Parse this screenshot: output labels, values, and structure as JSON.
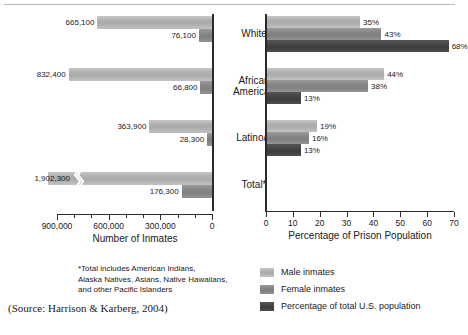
{
  "chart_data": [
    {
      "type": "bar",
      "orientation": "horizontal-reversed",
      "title": "",
      "xlabel": "Number of Inmates",
      "ylabel": "",
      "categories": [
        "White",
        "African American",
        "Latino/a",
        "Total*"
      ],
      "xlim": [
        0,
        900000
      ],
      "xticks": [
        900000,
        600000,
        300000,
        0
      ],
      "xtick_labels": [
        "900,000",
        "600,000",
        "300,000",
        "0"
      ],
      "minor_ticks": true,
      "grid": false,
      "series": [
        {
          "name": "Male inmates",
          "color": "#b3b3b3",
          "values": [
            665100,
            832400,
            363900,
            1902300
          ],
          "labels": [
            "665,100",
            "832,400",
            "363,900",
            "1,902,300"
          ],
          "axis_break_on": [
            "Total*"
          ]
        },
        {
          "name": "Female inmates",
          "color": "#858585",
          "values": [
            76100,
            66800,
            28300,
            176300
          ],
          "labels": [
            "76,100",
            "66,800",
            "28,300",
            "176,300"
          ]
        }
      ]
    },
    {
      "type": "bar",
      "orientation": "horizontal",
      "title": "",
      "xlabel": "Percentage of Prison Population",
      "ylabel": "",
      "categories": [
        "White",
        "African American",
        "Latino/a",
        "Total*"
      ],
      "xlim": [
        0,
        70
      ],
      "xticks": [
        0,
        10,
        20,
        30,
        40,
        50,
        60,
        70
      ],
      "xtick_labels": [
        "0",
        "10",
        "20",
        "30",
        "40",
        "50",
        "60",
        "70"
      ],
      "grid": false,
      "series": [
        {
          "name": "Male inmates",
          "color": "#b3b3b3",
          "values": [
            35,
            44,
            19,
            null
          ],
          "labels": [
            "35%",
            "44%",
            "19%",
            ""
          ]
        },
        {
          "name": "Female inmates",
          "color": "#858585",
          "values": [
            43,
            38,
            16,
            null
          ],
          "labels": [
            "43%",
            "38%",
            "16%",
            ""
          ]
        },
        {
          "name": "Percentage of total U.S. population",
          "color": "#474747",
          "values": [
            68,
            13,
            13,
            null
          ],
          "labels": [
            "68%",
            "13%",
            "13%",
            ""
          ]
        }
      ]
    }
  ],
  "left_chart": {
    "axis_title": "Number of Inmates",
    "tick_labels": [
      "900,000",
      "600,000",
      "300,000",
      "0"
    ],
    "bars": [
      {
        "label": "665,100",
        "series": "male"
      },
      {
        "label": "76,100",
        "series": "female"
      },
      {
        "label": "832,400",
        "series": "male"
      },
      {
        "label": "66,800",
        "series": "female"
      },
      {
        "label": "363,900",
        "series": "male"
      },
      {
        "label": "28,300",
        "series": "female"
      },
      {
        "label": "1,902,300",
        "series": "male"
      },
      {
        "label": "176,300",
        "series": "female"
      }
    ]
  },
  "right_chart": {
    "axis_title": "Percentage of Prison Population",
    "tick_labels": [
      "0",
      "10",
      "20",
      "30",
      "40",
      "50",
      "60",
      "70"
    ],
    "bars": [
      {
        "label": "35%",
        "series": "male"
      },
      {
        "label": "43%",
        "series": "female"
      },
      {
        "label": "68%",
        "series": "uspop"
      },
      {
        "label": "44%",
        "series": "male"
      },
      {
        "label": "38%",
        "series": "female"
      },
      {
        "label": "13%",
        "series": "uspop"
      },
      {
        "label": "19%",
        "series": "male"
      },
      {
        "label": "16%",
        "series": "female"
      },
      {
        "label": "13%",
        "series": "uspop"
      }
    ]
  },
  "categories": [
    {
      "line1": "White",
      "line2": ""
    },
    {
      "line1": "African",
      "line2": "American"
    },
    {
      "line1": "Latino/a",
      "line2": ""
    },
    {
      "line1": "Total*",
      "line2": ""
    }
  ],
  "legend": {
    "items": [
      {
        "label": "Male inmates",
        "color": "#b3b3b3"
      },
      {
        "label": "Female inmates",
        "color": "#858585"
      },
      {
        "label": "Percentage of total U.S. population",
        "color": "#474747"
      }
    ]
  },
  "footnote": {
    "line1": "*Total includes American Indians,",
    "line2": "Alaska Natives, Asians, Native Hawaiians,",
    "line3": "and other Pacific Islanders"
  },
  "source": "(Source: Harrison & Karberg, 2004)"
}
